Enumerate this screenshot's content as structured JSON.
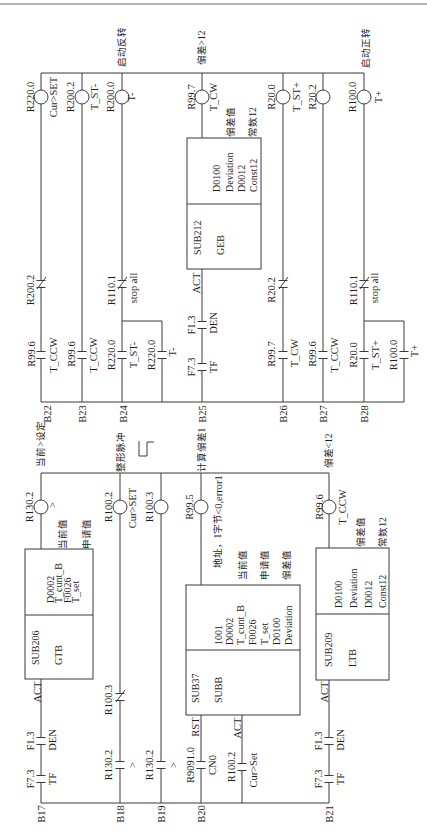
{
  "style": {
    "ink": "#3a3a3a",
    "paper": "#ffffff"
  },
  "upper": {
    "rungs": [
      {
        "id": "B22",
        "coil": {
          "address": "R220.0",
          "label": "Cur>SET"
        },
        "contacts": [
          {
            "type": "NC",
            "address": "R200.2"
          },
          {
            "type": "NO",
            "address": "R99.6",
            "label": "T_CCW"
          }
        ]
      },
      {
        "id": "B23",
        "coil": {
          "address": "R200.2",
          "label": "T_ST-"
        },
        "contacts": [
          {
            "type": "NO",
            "address": "R99.6",
            "label": "T_CCW"
          }
        ]
      },
      {
        "id": "B24",
        "comment": "启动反转",
        "coil": {
          "address": "R200.0",
          "label": "T-"
        },
        "contacts": [
          {
            "type": "NC",
            "address": "R110.1",
            "label": "stop all"
          },
          {
            "type": "NO",
            "address": "R220.0",
            "label": "T_ST-"
          },
          {
            "type": "NO",
            "address": "R220.0",
            "label": "T-",
            "parallel": true
          }
        ]
      },
      {
        "id": "B25",
        "comment": "偏差>12",
        "coil": {
          "address": "R99.7",
          "label": "T_CW"
        },
        "block": {
          "sub": "SUB212",
          "name": "GEB",
          "enable": "ACT",
          "params": [
            "D0100",
            "Deviation",
            "D0012",
            "Const12"
          ],
          "notes": [
            "偏差值",
            "常数12"
          ]
        },
        "contacts": [
          {
            "type": "NO",
            "address": "F1.3",
            "label": "DEN"
          },
          {
            "type": "NO",
            "address": "F7.3",
            "label": "TF"
          }
        ]
      },
      {
        "id": "B26",
        "coil": {
          "address": "R20.0",
          "label": "T_ST+"
        },
        "contacts": [
          {
            "type": "NC",
            "address": "R20.2"
          },
          {
            "type": "NO",
            "address": "R99.7",
            "label": "T_CW"
          }
        ]
      },
      {
        "id": "B27",
        "coil": {
          "address": "R20.2"
        },
        "contacts": [
          {
            "type": "NO",
            "address": "R99.6",
            "label": "T_CCW"
          }
        ]
      },
      {
        "id": "B28",
        "comment": "启动正转",
        "coil": {
          "address": "R100.0",
          "label": "T+"
        },
        "contacts": [
          {
            "type": "NC",
            "address": "R110.1",
            "label": "stop all"
          },
          {
            "type": "NO",
            "address": "R20.0",
            "label": "T_ST+"
          },
          {
            "type": "NO",
            "address": "R100.0",
            "label": "T+",
            "parallel": true
          }
        ]
      }
    ]
  },
  "lower": {
    "pulse_icon": "pulse-waveform",
    "rungs": [
      {
        "id": "B17",
        "comment": "当前>设定",
        "coil": {
          "address": "R130.2",
          "label": ">"
        },
        "block": {
          "sub": "SUB206",
          "name": "GTB",
          "enable": "ACT",
          "params": [
            "D0002",
            "T_cunt_B",
            "F0026",
            "T_set"
          ],
          "notes": [
            "当前值",
            "申请值"
          ]
        },
        "contacts": [
          {
            "type": "NO",
            "address": "F1.3",
            "label": "DEN"
          },
          {
            "type": "NO",
            "address": "F7.3",
            "label": "TF"
          }
        ]
      },
      {
        "id": "B18",
        "comment": "整形脉冲",
        "coil": {
          "address": "R100.2",
          "label": "Cur>SET"
        },
        "contacts": [
          {
            "type": "NC",
            "address": "R100.3"
          },
          {
            "type": "NO",
            "address": "R130.2",
            "label": ">"
          }
        ]
      },
      {
        "id": "B19",
        "coil": {
          "address": "R100.3"
        },
        "contacts": [
          {
            "type": "NO",
            "address": "R130.2",
            "label": ">"
          }
        ]
      },
      {
        "id": "B20",
        "comment": "计算偏差1",
        "coil": {
          "address": "R99.5",
          "label": "<0,error1"
        },
        "block": {
          "sub": "SUB37",
          "name": "SUBB",
          "reset": "RST",
          "enable": "ACT",
          "params": [
            "1001",
            "D0002",
            "T_cunt_B",
            "F0026",
            "T_set",
            "D0100",
            "Deviation"
          ],
          "notes": [
            "地址，1字节",
            "当前值",
            "申请值",
            "偏差值"
          ]
        },
        "contacts": [
          {
            "type": "NO",
            "address": "R9091.0",
            "label": "CN0"
          },
          {
            "type": "NO",
            "address": "R100.2",
            "label": "Cur>Set"
          }
        ]
      },
      {
        "id": "B21",
        "comment": "偏差<12",
        "coil": {
          "address": "R99.6",
          "label": "T_CCW"
        },
        "block": {
          "sub": "SUB209",
          "name": "LTB",
          "enable": "ACT",
          "params": [
            "D0100",
            "Deviation",
            "D0012",
            "Const12"
          ],
          "notes": [
            "偏差值",
            "常数12"
          ]
        },
        "contacts": [
          {
            "type": "NO",
            "address": "F1.3",
            "label": "DEN"
          },
          {
            "type": "NO",
            "address": "F7.3",
            "label": "TF"
          }
        ]
      }
    ]
  }
}
